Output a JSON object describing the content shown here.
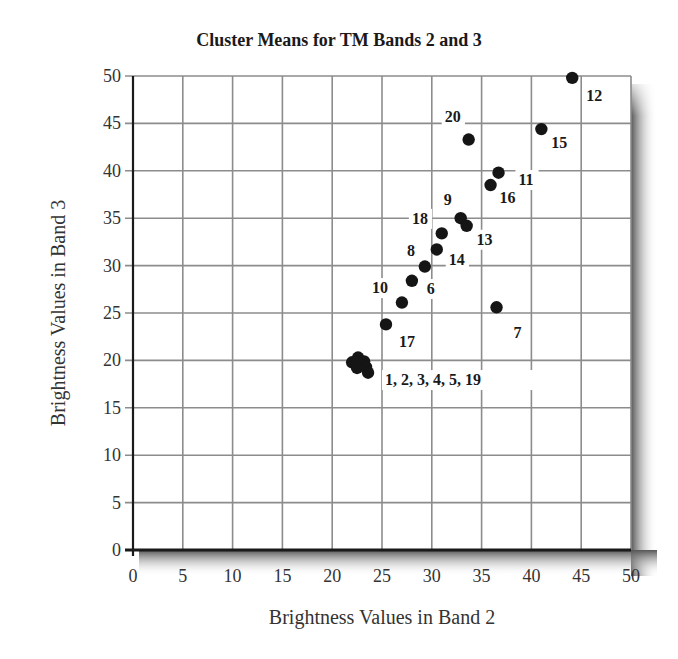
{
  "chart_data": {
    "type": "scatter",
    "title": "Cluster Means for TM Bands 2 and 3",
    "xlabel": "Brightness Values in Band 2",
    "ylabel": "Brightness Values in Band 3",
    "xlim": [
      0,
      50
    ],
    "ylim": [
      0,
      50
    ],
    "xticks": [
      0,
      5,
      10,
      15,
      20,
      25,
      30,
      35,
      40,
      45,
      50
    ],
    "yticks": [
      0,
      5,
      10,
      15,
      20,
      25,
      30,
      35,
      40,
      45,
      50
    ],
    "grid": true,
    "legend": null,
    "points": [
      {
        "cluster": "1",
        "x": 22.0,
        "y": 19.8
      },
      {
        "cluster": "2",
        "x": 22.6,
        "y": 20.3
      },
      {
        "cluster": "3",
        "x": 23.2,
        "y": 19.9
      },
      {
        "cluster": "4",
        "x": 22.5,
        "y": 19.2
      },
      {
        "cluster": "5",
        "x": 23.4,
        "y": 19.3
      },
      {
        "cluster": "19",
        "x": 23.6,
        "y": 18.7
      },
      {
        "cluster": "6",
        "x": 28.0,
        "y": 28.4
      },
      {
        "cluster": "7",
        "x": 36.5,
        "y": 25.6
      },
      {
        "cluster": "8",
        "x": 29.3,
        "y": 29.9
      },
      {
        "cluster": "9",
        "x": 32.9,
        "y": 35.0
      },
      {
        "cluster": "10",
        "x": 27.0,
        "y": 26.1
      },
      {
        "cluster": "11",
        "x": 36.7,
        "y": 39.8
      },
      {
        "cluster": "12",
        "x": 44.1,
        "y": 49.8
      },
      {
        "cluster": "13",
        "x": 33.5,
        "y": 34.2
      },
      {
        "cluster": "14",
        "x": 30.5,
        "y": 31.7
      },
      {
        "cluster": "15",
        "x": 41.0,
        "y": 44.4
      },
      {
        "cluster": "16",
        "x": 35.9,
        "y": 38.5
      },
      {
        "cluster": "17",
        "x": 25.4,
        "y": 23.8
      },
      {
        "cluster": "18",
        "x": 31.0,
        "y": 33.4
      },
      {
        "cluster": "20",
        "x": 33.7,
        "y": 43.3
      }
    ],
    "annotations": [
      {
        "text": "1, 2, 3, 4, 5, 19",
        "x": 25.3,
        "y": 17.4
      },
      {
        "text": "17",
        "x": 26.7,
        "y": 21.4
      },
      {
        "text": "10",
        "x": 24.0,
        "y": 27.1
      },
      {
        "text": "6",
        "x": 29.5,
        "y": 27.0
      },
      {
        "text": "8",
        "x": 27.5,
        "y": 31.0
      },
      {
        "text": "14",
        "x": 31.7,
        "y": 30.1
      },
      {
        "text": "18",
        "x": 28.0,
        "y": 34.4
      },
      {
        "text": "9",
        "x": 31.2,
        "y": 36.4
      },
      {
        "text": "13",
        "x": 34.5,
        "y": 32.2
      },
      {
        "text": "16",
        "x": 36.8,
        "y": 36.6
      },
      {
        "text": "11",
        "x": 38.7,
        "y": 38.5
      },
      {
        "text": "20",
        "x": 31.3,
        "y": 45.2
      },
      {
        "text": "15",
        "x": 42.0,
        "y": 42.4
      },
      {
        "text": "12",
        "x": 45.5,
        "y": 47.4
      },
      {
        "text": "7",
        "x": 38.2,
        "y": 22.4
      }
    ]
  },
  "title": "Cluster Means for TM Bands 2 and 3",
  "xlabel": "Brightness Values in Band 2",
  "ylabel": "Brightness Values in Band 3",
  "style": {
    "grid_color": "#8c8c8c",
    "axis_color": "#1a1a1a",
    "point_color": "#151515",
    "shadow_color": "#6b6b6b"
  }
}
